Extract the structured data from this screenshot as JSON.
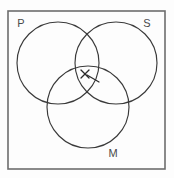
{
  "figure": {
    "background_color": "#fdfdfd",
    "frame": {
      "label": "outer-frame",
      "color": "#6d6d6d",
      "x": 8,
      "y": 11,
      "width": 157,
      "height": 158
    },
    "stroke_color": "#3a3a3a",
    "mark_color": "#2a2a2a"
  },
  "circles": [
    {
      "id": "P",
      "label": "P",
      "cx": 58,
      "cy": 63,
      "r": 41,
      "label_x": 21,
      "label_y": 24
    },
    {
      "id": "S",
      "label": "S",
      "cx": 116,
      "cy": 63,
      "r": 41,
      "label_x": 147,
      "label_y": 24
    },
    {
      "id": "M",
      "label": "M",
      "cx": 88,
      "cy": 107,
      "r": 41,
      "label_x": 113,
      "label_y": 154
    }
  ],
  "marks": [
    {
      "id": "center-x-mark",
      "type": "x-mark",
      "x": 85,
      "y": 74,
      "size": 4,
      "description": "X placed in the central intersection of P, S and M"
    },
    {
      "id": "pointer-line",
      "type": "leader-line",
      "x1": 99,
      "y1": 82,
      "x2": 87,
      "y2": 75,
      "description": "short pointer stroke aimed at the central X"
    }
  ],
  "labels": {
    "p": "P",
    "s": "S",
    "m": "M"
  }
}
